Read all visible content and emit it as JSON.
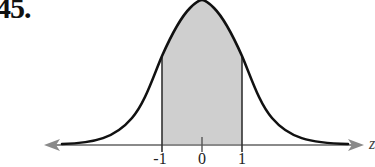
{
  "problem": {
    "number": "45."
  },
  "figure": {
    "type": "normal-distribution-curve",
    "axis_variable": "z",
    "ticks": [
      {
        "value": -1,
        "label": "-1"
      },
      {
        "value": 0,
        "label": "0"
      },
      {
        "value": 1,
        "label": "1"
      }
    ],
    "shaded_region": {
      "from": -1,
      "to": 1
    },
    "colors": {
      "curve": "#111111",
      "axis": "#888888",
      "shade": "#cfcfcf",
      "boundary": "#333333"
    }
  }
}
